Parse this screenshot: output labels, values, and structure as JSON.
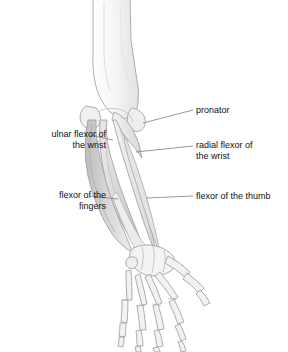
{
  "illustration": {
    "subject": "right forearm and hand, anterior view",
    "style": "grayscale anatomical line drawing",
    "background": "#ffffff",
    "line_color": "#8a8a8a",
    "muscle_fill_light": "#e9e9e9",
    "muscle_fill_mid": "#cfcfcf",
    "muscle_fill_dark": "#b0b0b0",
    "bone_fill": "#f4f4f2",
    "leader_color": "#7d7d7d"
  },
  "labels": {
    "ulnar_flexor": "ulnar flexor of\nthe wrist",
    "flexor_fingers": "flexor of the\nfingers",
    "pronator": "pronator",
    "radial_flexor": "radial flexor of\nthe wrist",
    "flexor_thumb": "flexor of the thumb"
  },
  "structures": [
    {
      "name": "humerus",
      "type": "bone"
    },
    {
      "name": "ulna",
      "type": "bone"
    },
    {
      "name": "radius",
      "type": "bone"
    },
    {
      "name": "carpals",
      "type": "bone"
    },
    {
      "name": "metacarpals",
      "type": "bone"
    },
    {
      "name": "phalanges",
      "type": "bone"
    },
    {
      "name": "pronator teres",
      "type": "muscle"
    },
    {
      "name": "flexor carpi radialis",
      "type": "muscle"
    },
    {
      "name": "flexor carpi ulnaris",
      "type": "muscle"
    },
    {
      "name": "flexor digitorum",
      "type": "muscle"
    },
    {
      "name": "flexor pollicis longus",
      "type": "muscle"
    }
  ]
}
